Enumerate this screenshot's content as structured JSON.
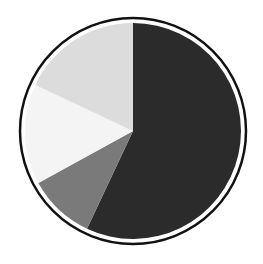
{
  "chart_data": {
    "type": "pie",
    "title": "",
    "start_angle_deg": 0,
    "direction": "clockwise",
    "labels": [
      "Slice 1 (dark)",
      "Slice 2 (mid gray)",
      "Slice 3 (white)",
      "Slice 4 (light gray)"
    ],
    "values": [
      57,
      10,
      15,
      18
    ],
    "colors": [
      "#2b2b2b",
      "#7a7a7a",
      "#f4f4f4",
      "#dcdcdc"
    ],
    "legend": null,
    "outline": {
      "color": "#111111",
      "width": 2.5
    }
  }
}
